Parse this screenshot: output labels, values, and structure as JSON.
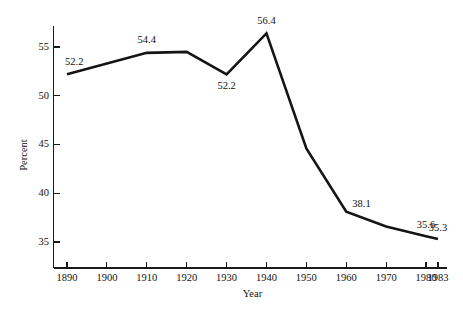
{
  "chart_data": {
    "type": "line",
    "title": "",
    "xlabel": "Year",
    "ylabel": "Percent",
    "x": [
      1890,
      1900,
      1910,
      1920,
      1930,
      1940,
      1950,
      1960,
      1970,
      1980,
      1983
    ],
    "values": [
      52.2,
      53.3,
      54.4,
      54.5,
      52.2,
      56.4,
      44.6,
      38.1,
      36.6,
      35.6,
      35.3
    ],
    "xlim": [
      1890,
      1983
    ],
    "ylim": [
      32.5,
      57.6
    ],
    "grid": false,
    "legend": "none",
    "xtick_labels": [
      "1890",
      "1900",
      "1910",
      "1920",
      "1930",
      "1940",
      "1950",
      "1960",
      "1970",
      "1980",
      "1983"
    ],
    "xtick_values": [
      1890,
      1900,
      1910,
      1920,
      1930,
      1940,
      1950,
      1960,
      1970,
      1980,
      1983
    ],
    "ytick_labels": [
      "55",
      "50",
      "45",
      "40",
      "35"
    ],
    "ytick_values": [
      55,
      50,
      45,
      40,
      35
    ],
    "line_color": "#151515",
    "point_annotations": [
      {
        "x": 1890,
        "y": 52.2,
        "label": "52.2",
        "dx": -2,
        "dy": -9,
        "anchor": "start"
      },
      {
        "x": 1910,
        "y": 54.4,
        "label": "54.4",
        "dx": 0,
        "dy": -10,
        "anchor": "middle"
      },
      {
        "x": 1930,
        "y": 52.2,
        "label": "52.2",
        "dx": 0,
        "dy": 15,
        "anchor": "middle"
      },
      {
        "x": 1940,
        "y": 56.4,
        "label": "56.4",
        "dx": 0,
        "dy": -9,
        "anchor": "middle"
      },
      {
        "x": 1960,
        "y": 38.1,
        "label": "38.1",
        "dx": 6,
        "dy": -5,
        "anchor": "start"
      },
      {
        "x": 1980,
        "y": 35.6,
        "label": "35.6",
        "dx": 0,
        "dy": -8,
        "anchor": "middle"
      },
      {
        "x": 1983,
        "y": 35.3,
        "label": "35.3",
        "dx": 0,
        "dy": -8,
        "anchor": "middle"
      }
    ]
  }
}
